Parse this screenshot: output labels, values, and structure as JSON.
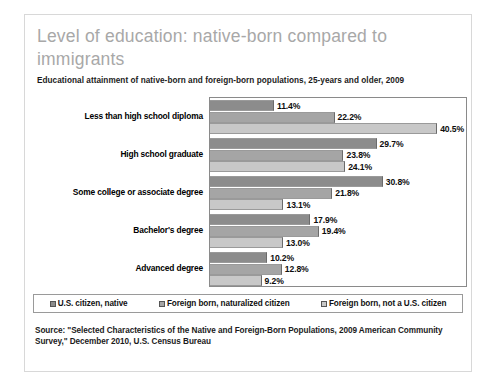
{
  "card": {
    "title": "Level of education: native-born compared to immigrants",
    "subtitle": "Educational attainment of native-born and foreign-born populations, 25-years and older, 2009",
    "source": "Source: \"Selected Characteristics of the Native and Foreign-Born Populations, 2009 American Community Survey,\" December 2010, U.S. Census Bureau"
  },
  "legend": {
    "items": [
      {
        "label": "U.S. citizen, native",
        "color": "#8c8c8c"
      },
      {
        "label": "Foreign born, naturalized citizen",
        "color": "#a5a5a5"
      },
      {
        "label": "Foreign born, not a U.S. citizen",
        "color": "#c8c8c8"
      }
    ]
  },
  "chart_data": {
    "type": "bar",
    "orientation": "horizontal",
    "title": "Level of education: native-born compared to immigrants",
    "subtitle": "Educational attainment of native-born and foreign-born populations, 25-years and older, 2009",
    "xlabel": "",
    "ylabel": "",
    "xlim": [
      0,
      46
    ],
    "grid": false,
    "legend_position": "bottom",
    "value_suffix": "%",
    "categories": [
      "Less than high school diploma",
      "High school graduate",
      "Some college or associate degree",
      "Bachelor's degree",
      "Advanced degree"
    ],
    "series": [
      {
        "name": "U.S. citizen, native",
        "color": "#8c8c8c",
        "values": [
          11.4,
          29.7,
          30.8,
          17.9,
          10.2
        ],
        "labels": [
          "11.4%",
          "29.7%",
          "30.8%",
          "17.9%",
          "10.2%"
        ]
      },
      {
        "name": "Foreign born, naturalized citizen",
        "color": "#a5a5a5",
        "values": [
          22.2,
          23.8,
          21.8,
          19.4,
          12.8
        ],
        "labels": [
          "22.2%",
          "23.8%",
          "21.8%",
          "19.4%",
          "12.8%"
        ]
      },
      {
        "name": "Foreign born, not a U.S. citizen",
        "color": "#c8c8c8",
        "values": [
          40.5,
          24.1,
          13.1,
          13.0,
          9.2
        ],
        "labels": [
          "40.5%",
          "24.1%",
          "13.1%",
          "13.0%",
          "9.2%"
        ]
      }
    ]
  }
}
